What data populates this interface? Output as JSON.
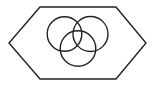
{
  "canvas": {
    "width": 155,
    "height": 87,
    "background": "#ffffff"
  },
  "stroke": {
    "color": "#222222",
    "width": 1.4
  },
  "hexagon": {
    "points": [
      [
        40,
        7
      ],
      [
        116,
        7
      ],
      [
        146,
        43
      ],
      [
        116,
        79
      ],
      [
        40,
        79
      ],
      [
        9,
        43
      ]
    ]
  },
  "circles": [
    {
      "name": "top-left",
      "cx": 64.5,
      "cy": 34,
      "r": 17.3
    },
    {
      "name": "top-right",
      "cx": 90.5,
      "cy": 34,
      "r": 17.5
    },
    {
      "name": "bottom",
      "cx": 78,
      "cy": 48.5,
      "r": 17.8
    }
  ]
}
